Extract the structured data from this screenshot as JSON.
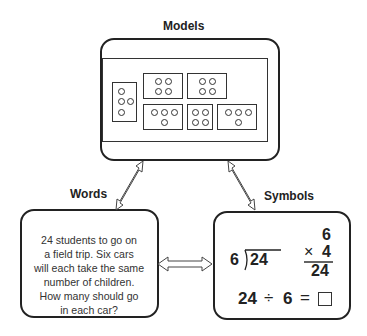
{
  "diagram": {
    "labels": {
      "models": "Models",
      "words": "Words",
      "symbols": "Symbols"
    },
    "models": {
      "cards": [
        {
          "dots": 4,
          "layout": "1-2-1 vertical"
        },
        {
          "dots": 4,
          "layout": "2x2"
        },
        {
          "dots": 4,
          "layout": "2x2"
        },
        {
          "dots": 4,
          "layout": "3-1"
        },
        {
          "dots": 4,
          "layout": "2x2"
        },
        {
          "dots": 4,
          "layout": "3-1"
        }
      ]
    },
    "words": {
      "lines": [
        "24 students to go on",
        "a field trip.  Six cars",
        "will each take the same",
        "number of children.",
        "How many should go",
        "in each car?"
      ]
    },
    "symbols": {
      "long_division": {
        "divisor": "6",
        "dividend": "24"
      },
      "multiplication": {
        "top": "6",
        "operator": "×",
        "multiplier": "4",
        "product": "24"
      },
      "equation": {
        "left": "24",
        "operator": "÷",
        "right": "6",
        "equals": "=",
        "answer_box": "□"
      }
    },
    "connections": [
      {
        "from": "Models",
        "to": "Words",
        "type": "double-arrow"
      },
      {
        "from": "Models",
        "to": "Symbols",
        "type": "double-arrow"
      },
      {
        "from": "Words",
        "to": "Symbols",
        "type": "double-arrow"
      }
    ]
  }
}
